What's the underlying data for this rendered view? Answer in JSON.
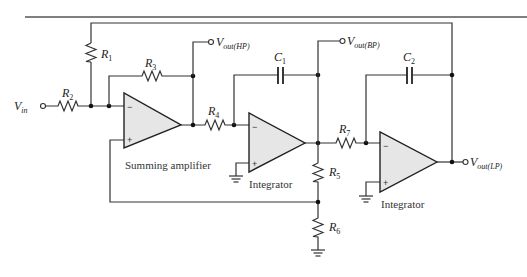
{
  "diagram": {
    "input": {
      "symbol": "V",
      "subscript": "in"
    },
    "outputs": [
      {
        "id": "hp",
        "symbol": "V",
        "subscript": "out(HP)"
      },
      {
        "id": "bp",
        "symbol": "V",
        "subscript": "out(BP)"
      },
      {
        "id": "lp",
        "symbol": "V",
        "subscript": "out(LP)"
      }
    ],
    "resistors": [
      {
        "id": "R1",
        "symbol": "R",
        "subscript": "1"
      },
      {
        "id": "R2",
        "symbol": "R",
        "subscript": "2"
      },
      {
        "id": "R3",
        "symbol": "R",
        "subscript": "3"
      },
      {
        "id": "R4",
        "symbol": "R",
        "subscript": "4"
      },
      {
        "id": "R5",
        "symbol": "R",
        "subscript": "5"
      },
      {
        "id": "R6",
        "symbol": "R",
        "subscript": "6"
      },
      {
        "id": "R7",
        "symbol": "R",
        "subscript": "7"
      }
    ],
    "capacitors": [
      {
        "id": "C1",
        "symbol": "C",
        "subscript": "1"
      },
      {
        "id": "C2",
        "symbol": "C",
        "subscript": "2"
      }
    ],
    "stages": [
      {
        "id": "summing",
        "label": "Summing amplifier",
        "inv": "−",
        "noninv": "+"
      },
      {
        "id": "integrator1",
        "label": "Integrator",
        "inv": "−",
        "noninv": "+"
      },
      {
        "id": "integrator2",
        "label": "Integrator",
        "inv": "−",
        "noninv": "+"
      }
    ],
    "colors": {
      "wire": "#333333",
      "opamp_fill": "#e6e6e6",
      "background": "#ffffff"
    }
  }
}
